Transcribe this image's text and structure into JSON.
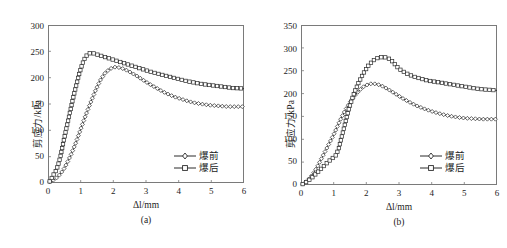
{
  "figure": {
    "background": "#ffffff",
    "line_color": "#2a2a2a",
    "frame_color": "#7a7a7a"
  },
  "panels": [
    {
      "caption": "(a)",
      "xlabel": "Δl/mm",
      "ylabel": "剪应力/kPa",
      "legend": [
        {
          "label": "爆前",
          "marker": "diamond"
        },
        {
          "label": "爆后",
          "marker": "square"
        }
      ],
      "yticks": [
        "0",
        "50",
        "100",
        "150",
        "200",
        "250",
        "300"
      ],
      "xticks": [
        "0",
        "1",
        "2",
        "3",
        "4",
        "5",
        "6"
      ]
    },
    {
      "caption": "(b)",
      "xlabel": "Δl/mm",
      "ylabel": "剪应力/kPa",
      "legend": [
        {
          "label": "爆前",
          "marker": "diamond"
        },
        {
          "label": "爆后",
          "marker": "square"
        }
      ],
      "yticks": [
        "0",
        "50",
        "100",
        "150",
        "200",
        "250",
        "300",
        "350"
      ],
      "xticks": [
        "0",
        "1",
        "2",
        "3",
        "4",
        "5",
        "6"
      ]
    }
  ],
  "chart_data": [
    {
      "type": "line",
      "title": "(a)",
      "xlabel": "Δl/mm",
      "ylabel": "剪应力/kPa",
      "xlim": [
        0,
        6
      ],
      "ylim": [
        0,
        300
      ],
      "xticks": [
        0,
        1,
        2,
        3,
        4,
        5,
        6
      ],
      "yticks": [
        0,
        50,
        100,
        150,
        200,
        250,
        300
      ],
      "grid": false,
      "legend_position": "lower-right",
      "series": [
        {
          "name": "爆前",
          "marker": "diamond",
          "x": [
            0.05,
            0.12,
            0.18,
            0.25,
            0.32,
            0.4,
            0.5,
            0.6,
            0.72,
            0.85,
            1.0,
            1.15,
            1.3,
            1.45,
            1.6,
            1.75,
            1.9,
            2.05,
            2.2,
            2.35,
            2.5,
            2.7,
            2.9,
            3.1,
            3.3,
            3.5,
            3.7,
            3.9,
            4.1,
            4.3,
            4.5,
            4.7,
            4.9,
            5.1,
            5.3,
            5.5,
            5.7,
            5.85,
            6.0
          ],
          "y": [
            2,
            4,
            6,
            9,
            13,
            19,
            28,
            40,
            56,
            76,
            102,
            128,
            152,
            175,
            195,
            209,
            217,
            220,
            219,
            216,
            211,
            204,
            196,
            188,
            181,
            174,
            168,
            163,
            159,
            155,
            152,
            150,
            148,
            147,
            146,
            145,
            145,
            145,
            145
          ]
        },
        {
          "name": "爆后",
          "marker": "square",
          "x": [
            0.05,
            0.1,
            0.15,
            0.2,
            0.25,
            0.3,
            0.38,
            0.46,
            0.55,
            0.65,
            0.75,
            0.85,
            0.95,
            1.05,
            1.15,
            1.25,
            1.35,
            1.45,
            1.55,
            1.7,
            1.85,
            2.0,
            2.2,
            2.4,
            2.6,
            2.8,
            3.0,
            3.2,
            3.45,
            3.7,
            3.95,
            4.2,
            4.45,
            4.7,
            4.95,
            5.2,
            5.45,
            5.7,
            5.85,
            6.0
          ],
          "y": [
            3,
            8,
            14,
            19,
            24,
            32,
            50,
            74,
            100,
            128,
            156,
            182,
            206,
            226,
            240,
            246,
            247,
            245,
            243,
            240,
            237,
            234,
            230,
            226,
            222,
            218,
            214,
            210,
            206,
            202,
            198,
            194,
            191,
            188,
            186,
            184,
            182,
            180,
            180,
            179
          ]
        }
      ]
    },
    {
      "type": "line",
      "title": "(b)",
      "xlabel": "Δl/mm",
      "ylabel": "剪应力/kPa",
      "xlim": [
        0,
        6
      ],
      "ylim": [
        0,
        350
      ],
      "xticks": [
        0,
        1,
        2,
        3,
        4,
        5,
        6
      ],
      "yticks": [
        0,
        50,
        100,
        150,
        200,
        250,
        300,
        350
      ],
      "grid": false,
      "legend_position": "lower-right",
      "series": [
        {
          "name": "爆前",
          "marker": "diamond",
          "x": [
            0.05,
            0.12,
            0.2,
            0.3,
            0.4,
            0.5,
            0.6,
            0.7,
            0.8,
            0.9,
            1.0,
            1.1,
            1.2,
            1.35,
            1.5,
            1.65,
            1.8,
            1.95,
            2.1,
            2.2,
            2.35,
            2.5,
            2.7,
            2.9,
            3.1,
            3.3,
            3.55,
            3.8,
            4.05,
            4.3,
            4.55,
            4.8,
            5.05,
            5.3,
            5.55,
            5.8,
            6.0
          ],
          "y": [
            2,
            5,
            10,
            18,
            28,
            40,
            54,
            68,
            82,
            96,
            110,
            126,
            142,
            163,
            181,
            196,
            208,
            217,
            221,
            222,
            220,
            216,
            208,
            199,
            190,
            182,
            173,
            166,
            160,
            155,
            151,
            148,
            146,
            145,
            144,
            144,
            144
          ]
        },
        {
          "name": "爆后",
          "marker": "square",
          "x": [
            0.05,
            0.15,
            0.25,
            0.35,
            0.45,
            0.55,
            0.65,
            0.75,
            0.85,
            0.95,
            1.05,
            1.15,
            1.3,
            1.45,
            1.6,
            1.75,
            1.9,
            2.05,
            2.2,
            2.35,
            2.5,
            2.6,
            2.7,
            2.8,
            2.9,
            3.0,
            3.2,
            3.45,
            3.7,
            3.9,
            4.1,
            4.35,
            4.6,
            4.85,
            5.1,
            5.35,
            5.6,
            5.8,
            6.0
          ],
          "y": [
            2,
            6,
            11,
            17,
            24,
            31,
            38,
            45,
            52,
            58,
            63,
            78,
            120,
            163,
            196,
            222,
            243,
            260,
            272,
            278,
            280,
            279,
            276,
            270,
            262,
            254,
            245,
            237,
            232,
            228,
            226,
            223,
            220,
            217,
            214,
            211,
            209,
            208,
            207
          ]
        }
      ]
    }
  ]
}
